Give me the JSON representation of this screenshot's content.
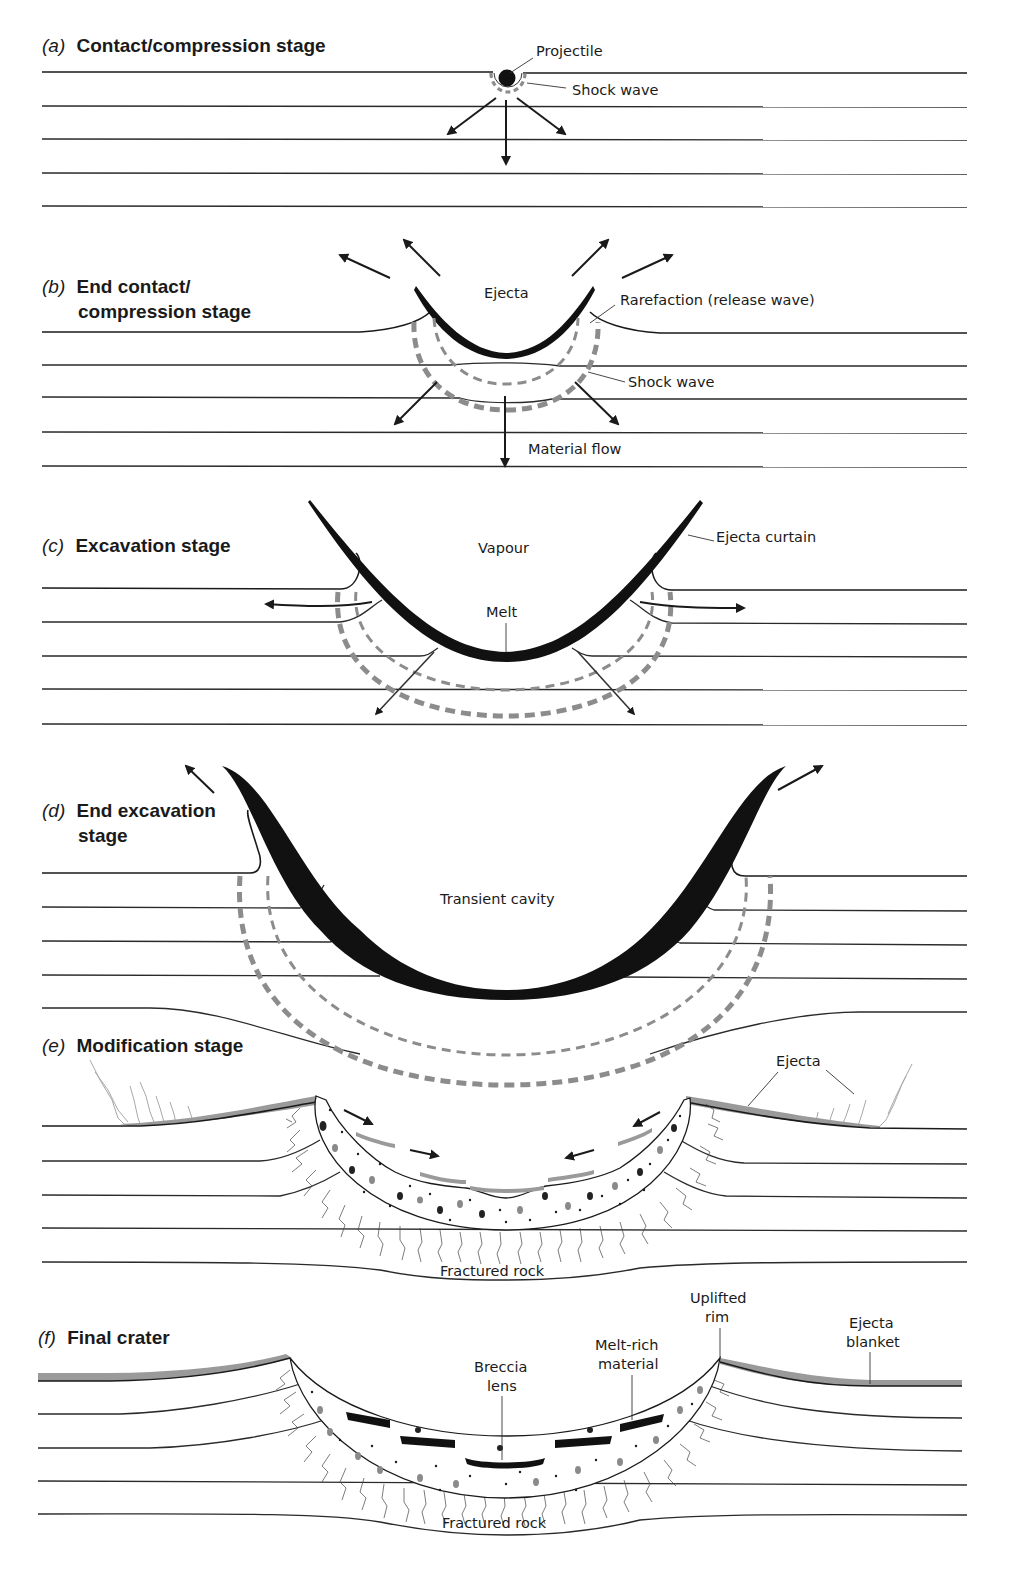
{
  "figure": {
    "panels": [
      {
        "id": "a",
        "letter": "(a)",
        "title_lines": [
          "Contact/compression stage"
        ],
        "annotations": [
          "Projectile",
          "Shock wave"
        ]
      },
      {
        "id": "b",
        "letter": "(b)",
        "title_lines": [
          "End contact/",
          "compression stage"
        ],
        "annotations": [
          "Ejecta",
          "Rarefaction (release wave)",
          "Shock wave",
          "Material flow"
        ]
      },
      {
        "id": "c",
        "letter": "(c)",
        "title_lines": [
          "Excavation stage"
        ],
        "annotations": [
          "Vapour",
          "Ejecta curtain",
          "Melt"
        ]
      },
      {
        "id": "d",
        "letter": "(d)",
        "title_lines": [
          "End excavation",
          "stage"
        ],
        "annotations": [
          "Transient cavity"
        ]
      },
      {
        "id": "e",
        "letter": "(e)",
        "title_lines": [
          "Modification stage"
        ],
        "annotations": [
          "Ejecta",
          "Fractured rock"
        ]
      },
      {
        "id": "f",
        "letter": "(f)",
        "title_lines": [
          "Final crater"
        ],
        "annotations": [
          "Uplifted rim",
          "Ejecta blanket",
          "Melt-rich material",
          "Breccia lens",
          "Fractured rock"
        ],
        "annotation_lines": {
          "uplifted_rim": [
            "Uplifted",
            "rim"
          ],
          "ejecta_blanket": [
            "Ejecta",
            "blanket"
          ],
          "melt_rich": [
            "Melt-rich",
            "material"
          ],
          "breccia_lens": [
            "Breccia",
            "lens"
          ]
        }
      }
    ],
    "colors": {
      "ink": "#1a1a1a",
      "shock_wave_grey": "#8c8c8c",
      "ejecta_grey": "#9a9a9a",
      "background": "#ffffff"
    }
  }
}
